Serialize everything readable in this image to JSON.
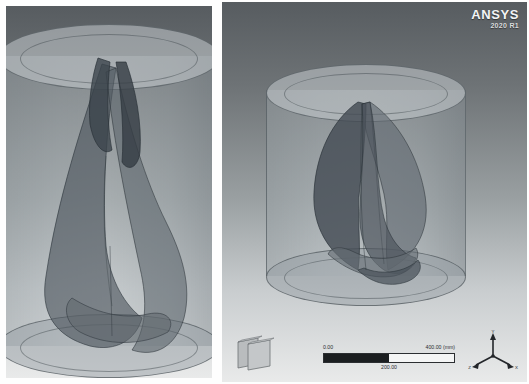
{
  "app": {
    "brand": "ANSYS",
    "release": "2020 R1"
  },
  "views": [
    {
      "name": "left-view",
      "label": "Zoomed isometric view of helical turbine in cylindrical fluid domain"
    },
    {
      "name": "right-view",
      "label": "Full isometric view of helical turbine in cylindrical fluid domain"
    }
  ],
  "scale_bar": {
    "min_label": "0.00",
    "mid_label": "200.00",
    "max_label": "400.00 (mm)",
    "units": "mm"
  },
  "triad": {
    "x_label": "X",
    "y_label": "Y",
    "z_label": "Z"
  },
  "geometry": {
    "domain_label": "cylindrical-fluid-domain",
    "rotor_label": "twisted-helical-blades",
    "blade_count": 2
  },
  "colors": {
    "background_top": "#575c60",
    "background_bottom": "#e9eaea",
    "domain_surface": "#9aa2a6",
    "rotor_surface": "#4e565c",
    "outline": "#3c444a",
    "logo_text": "#f3f4f5",
    "scalebar_fill": "#1b1e20"
  }
}
